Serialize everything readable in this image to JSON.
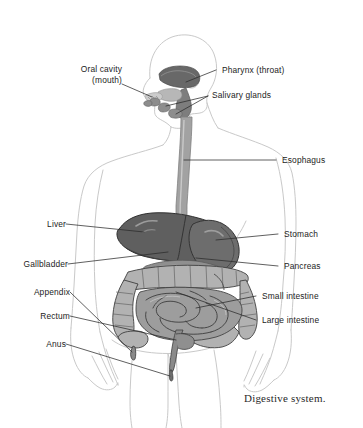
{
  "figure": {
    "caption": "Digestive system.",
    "background_color": "#ffffff",
    "label_color": "#1c1c1c",
    "leader_line_color": "#2b2b2b",
    "body_outline_color": "#c9c9c9"
  },
  "labels": {
    "oral_cavity_line1": "Oral cavity",
    "oral_cavity_line2": "(mouth)",
    "pharynx": "Pharynx (throat)",
    "salivary_glands": "Salivary glands",
    "esophagus": "Esophagus",
    "liver": "Liver",
    "gallbladder": "Gallbladder",
    "appendix": "Appendix",
    "rectum": "Rectum",
    "anus": "Anus",
    "stomach": "Stomach",
    "pancreas": "Pancreas",
    "small_intestine": "Small intestine",
    "large_intestine": "Large intestine"
  },
  "organ_colors": {
    "liver": "#636363",
    "stomach": "#6e6e6e",
    "small_intestine": "#9a9a9a",
    "large_intestine": "#b0b0b0",
    "esophagus": "#9d9d9d",
    "pharynx": "#6a6a6a",
    "salivary_gland": "#8d8d8d",
    "rectum": "#8a8a8a"
  }
}
